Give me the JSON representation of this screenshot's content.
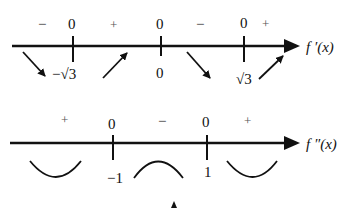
{
  "first_derivative": {
    "label": "f ′(x)",
    "signs": [
      "−",
      "+",
      "−",
      "+"
    ],
    "zeros_above": [
      "0",
      "0",
      "0"
    ],
    "critical_points": [
      "−√3",
      "0",
      "√3"
    ],
    "trend_arrows": [
      "decreasing",
      "increasing",
      "decreasing",
      "increasing"
    ]
  },
  "second_derivative": {
    "label": "f ″(x)",
    "signs": [
      "+",
      "−",
      "+"
    ],
    "zeros_above": [
      "0",
      "0"
    ],
    "inflection_points": [
      "−1",
      "1"
    ],
    "concavity": [
      "concave-up",
      "concave-down",
      "concave-up"
    ]
  },
  "colors": {
    "ink": "#111111",
    "background": "#ffffff"
  }
}
